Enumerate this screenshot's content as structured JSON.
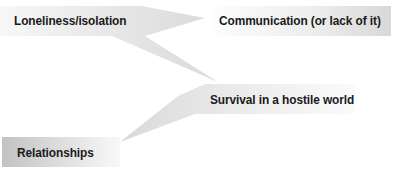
{
  "diagram": {
    "type": "callout-diagram",
    "nodes": [
      {
        "id": "loneliness",
        "label": "Loneliness/isolation"
      },
      {
        "id": "communication",
        "label": "Communication (or lack of it)"
      },
      {
        "id": "survival",
        "label": "Survival in a hostile world"
      },
      {
        "id": "relationships",
        "label": "Relationships"
      }
    ],
    "connections": [
      {
        "from": "loneliness",
        "to": "communication"
      },
      {
        "from": "loneliness",
        "to": "survival"
      },
      {
        "from": "survival",
        "to": "relationships"
      }
    ],
    "colors": {
      "box_dark": "#c4c4c4",
      "box_mid": "#dcdcdc",
      "box_light": "#f4f4f4",
      "text": "#1a1a1a",
      "background": "#ffffff"
    }
  }
}
